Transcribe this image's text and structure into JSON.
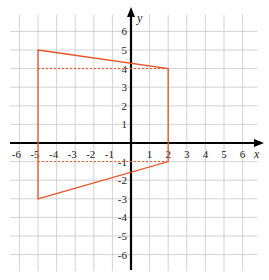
{
  "chart_data": {
    "type": "line",
    "title": "",
    "xlabel": "x",
    "ylabel": "y",
    "xlim": [
      -6.5,
      7
    ],
    "ylim": [
      -6.9,
      7
    ],
    "grid": true,
    "x_ticks": [
      -6,
      -5,
      -4,
      -3,
      -2,
      -1,
      1,
      2,
      3,
      4,
      5,
      6
    ],
    "y_ticks": [
      6,
      5,
      4,
      3,
      2,
      1,
      -1,
      -2,
      -3,
      -4,
      -5,
      -6
    ],
    "series": [
      {
        "name": "polygon",
        "style": "solid",
        "color": "#e8542a",
        "closed": true,
        "points": [
          [
            -5,
            5
          ],
          [
            2,
            4
          ],
          [
            2,
            -1
          ],
          [
            -5,
            -3
          ]
        ]
      },
      {
        "name": "dashed-y4",
        "style": "dashed",
        "color": "#e8542a",
        "points": [
          [
            -5,
            4
          ],
          [
            2,
            4
          ]
        ]
      },
      {
        "name": "dashed-y-1",
        "style": "dashed",
        "color": "#e8542a",
        "points": [
          [
            -5,
            -1
          ],
          [
            2,
            -1
          ]
        ]
      }
    ]
  },
  "colors": {
    "grid": "#c8c8c8",
    "axis": "#000000",
    "shape": "#e8542a"
  },
  "layout": {
    "origin_px": [
      131,
      143
    ],
    "unit_px": 18.6
  }
}
